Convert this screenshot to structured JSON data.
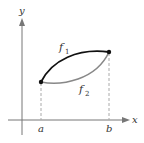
{
  "figure": {
    "type": "area-between-curves",
    "axes": {
      "x_label": "x",
      "y_label": "y",
      "color": "#777777"
    },
    "curves": [
      {
        "name": "f",
        "subscript": "1",
        "position": "upper",
        "color": "#111111"
      },
      {
        "name": "f",
        "subscript": "2",
        "position": "lower",
        "color": "#888888"
      }
    ],
    "interval": {
      "left_label": "a",
      "right_label": "b",
      "guide_style": "dashed",
      "guide_color": "#aaaaaa"
    },
    "points": [
      {
        "at": "a",
        "description": "left intersection of f1 and f2"
      },
      {
        "at": "b",
        "description": "right intersection of f1 and f2"
      }
    ]
  }
}
